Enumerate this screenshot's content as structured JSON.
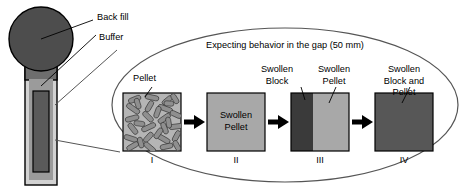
{
  "figure": {
    "title_in_ellipse": "Expecting behavior in the gap (50 mm)",
    "gap_size": "50 mm"
  },
  "canister": {
    "labels": {
      "back_fill": "Back fill",
      "buffer": "Buffer"
    },
    "colors": {
      "back_fill_circle": "#4d4d4d",
      "buffer_outer": "#d2d2d2",
      "buffer_band": "#9b9b9b",
      "canister_core": "#5a5a5a",
      "outline": "#000000"
    }
  },
  "gap_diagram": {
    "pellet_label": "Pellet",
    "stages": [
      {
        "numeral": "I",
        "top_label": "",
        "box_text": "",
        "kind": "pellet-texture"
      },
      {
        "numeral": "II",
        "top_label": "",
        "box_text": "Swollen\nPellet",
        "box_line1": "Swollen",
        "box_line2": "Pellet",
        "kind": "solid-mid"
      },
      {
        "numeral": "III",
        "top_label_a": "Swollen\nBlock",
        "top_label_a_line1": "Swollen",
        "top_label_a_line2": "Block",
        "top_label_b": "Swollen\nPellet",
        "top_label_b_line1": "Swollen",
        "top_label_b_line2": "Pellet",
        "box_text": "",
        "kind": "split-dark-mid"
      },
      {
        "numeral": "IV",
        "top_label": "Swollen\nBlock and Pellet",
        "top_label_line1": "Swollen",
        "top_label_line2": "Block and Pellet",
        "box_text": "",
        "kind": "solid-dark"
      }
    ],
    "colors": {
      "pellet_fill": "#b5b5b5",
      "pellet_grains": "#8c8c8c",
      "swollen_pellet": "#a8a8a8",
      "swollen_block_dark": "#3a3a3a",
      "swollen_block_and_pellet": "#575757",
      "arrow": "#000000",
      "ellipse_stroke": "#555555",
      "box_stroke": "#000000"
    }
  }
}
